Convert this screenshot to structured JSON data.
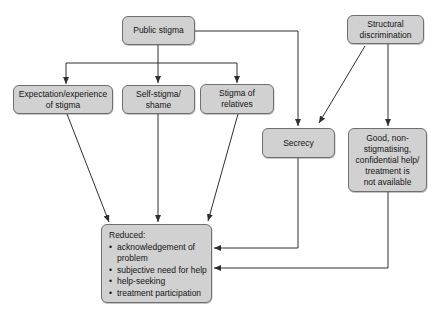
{
  "diagram": {
    "colors": {
      "background": "#ffffff",
      "box_fill": "#d1d1d1",
      "box_border": "#6f6f6f",
      "line": "#2f2f2f",
      "text": "#141414"
    },
    "boxes": {
      "public_stigma": {
        "label": "Public stigma"
      },
      "structural_discrimination": {
        "label": "Structural\ndiscrimination"
      },
      "expectation_experience": {
        "label": "Expectation/experience\nof stigma"
      },
      "self_stigma": {
        "label": "Self-stigma/\nshame"
      },
      "stigma_of_relatives": {
        "label": "Stigma of\nrelatives"
      },
      "secrecy": {
        "label": "Secrecy"
      },
      "help_not_available": {
        "label": "Good, non-\nstigmatising,\nconfidential help/\ntreatment is\nnot available"
      },
      "reduced_outcomes": {
        "title": "Reduced:",
        "bullets": [
          "acknowledgement of problem",
          "subjective need for help",
          "help-seeking",
          "treatment participation"
        ]
      }
    },
    "connections": [
      {
        "from": "public_stigma",
        "to": "expectation_experience"
      },
      {
        "from": "public_stigma",
        "to": "self_stigma"
      },
      {
        "from": "public_stigma",
        "to": "stigma_of_relatives"
      },
      {
        "from": "public_stigma",
        "to": "secrecy"
      },
      {
        "from": "structural_discrimination",
        "to": "secrecy"
      },
      {
        "from": "structural_discrimination",
        "to": "help_not_available"
      },
      {
        "from": "expectation_experience",
        "to": "reduced_outcomes"
      },
      {
        "from": "self_stigma",
        "to": "reduced_outcomes"
      },
      {
        "from": "stigma_of_relatives",
        "to": "reduced_outcomes"
      },
      {
        "from": "secrecy",
        "to": "reduced_outcomes"
      },
      {
        "from": "help_not_available",
        "to": "reduced_outcomes"
      }
    ]
  }
}
